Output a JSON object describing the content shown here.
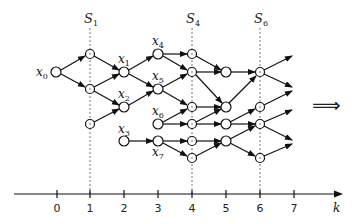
{
  "diagram": {
    "axis": {
      "label": "k",
      "ticks": [
        {
          "label": "0",
          "x": 57
        },
        {
          "label": "1",
          "x": 90
        },
        {
          "label": "2",
          "x": 124
        },
        {
          "label": "3",
          "x": 158
        },
        {
          "label": "4",
          "x": 192
        },
        {
          "label": "5",
          "x": 226
        },
        {
          "label": "6",
          "x": 260
        },
        {
          "label": "7",
          "x": 294
        }
      ]
    },
    "sections": [
      {
        "label": "S",
        "sub": "1",
        "x": 90
      },
      {
        "label": "S",
        "sub": "4",
        "x": 192
      },
      {
        "label": "S",
        "sub": "6",
        "x": 260
      }
    ],
    "implies_symbol": "⟹",
    "node_labels": [
      {
        "name": "x",
        "sub": "0",
        "x": 36,
        "y": 76
      },
      {
        "name": "x",
        "sub": "1",
        "x": 118,
        "y": 62
      },
      {
        "name": "x",
        "sub": "2",
        "x": 118,
        "y": 98
      },
      {
        "name": "x",
        "sub": "3",
        "x": 118,
        "y": 133
      },
      {
        "name": "x",
        "sub": "4",
        "x": 152,
        "y": 45
      },
      {
        "name": "x",
        "sub": "5",
        "x": 152,
        "y": 80
      },
      {
        "name": "x",
        "sub": "6",
        "x": 152,
        "y": 115
      },
      {
        "name": "x",
        "sub": "7",
        "x": 152,
        "y": 156
      }
    ]
  }
}
